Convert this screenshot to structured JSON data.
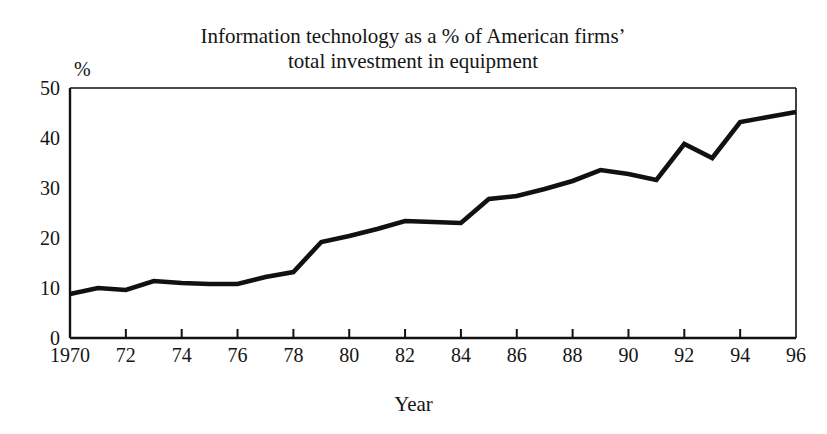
{
  "chart_data": {
    "type": "line",
    "title_line1": "Information technology as a % of American firms’",
    "title_line2": "total investment in equipment",
    "xlabel": "Year",
    "ylabel": "%",
    "y_unit_label": "%",
    "xlim": [
      1970,
      1996
    ],
    "ylim": [
      0,
      50
    ],
    "grid": false,
    "legend": null,
    "line_color": "#111111",
    "x_tick_labels": [
      "1970",
      "72",
      "74",
      "76",
      "78",
      "80",
      "82",
      "84",
      "86",
      "88",
      "90",
      "92",
      "94",
      "96"
    ],
    "x_tick_values": [
      1970,
      1972,
      1974,
      1976,
      1978,
      1980,
      1982,
      1984,
      1986,
      1988,
      1990,
      1992,
      1994,
      1996
    ],
    "y_tick_labels": [
      "0",
      "10",
      "20",
      "30",
      "40",
      "50"
    ],
    "y_tick_values": [
      0,
      10,
      20,
      30,
      40,
      50
    ],
    "x": [
      1970,
      1971,
      1972,
      1973,
      1974,
      1975,
      1976,
      1977,
      1978,
      1979,
      1980,
      1981,
      1982,
      1983,
      1984,
      1985,
      1986,
      1987,
      1988,
      1989,
      1990,
      1991,
      1992,
      1993,
      1994,
      1995,
      1996
    ],
    "values": [
      8.8,
      10.0,
      9.6,
      11.4,
      11.0,
      10.8,
      10.8,
      12.2,
      13.2,
      19.2,
      20.4,
      21.8,
      23.4,
      23.2,
      23.0,
      27.8,
      28.4,
      29.8,
      31.4,
      33.6,
      32.8,
      31.6,
      38.8,
      36.0,
      43.2,
      44.2,
      45.2
    ],
    "series": [
      {
        "name": "Information technology share of equipment investment",
        "values": [
          8.8,
          10.0,
          9.6,
          11.4,
          11.0,
          10.8,
          10.8,
          12.2,
          13.2,
          19.2,
          20.4,
          21.8,
          23.4,
          23.2,
          23.0,
          27.8,
          28.4,
          29.8,
          31.4,
          33.6,
          32.8,
          31.6,
          38.8,
          36.0,
          43.2,
          44.2,
          45.2
        ]
      }
    ]
  }
}
